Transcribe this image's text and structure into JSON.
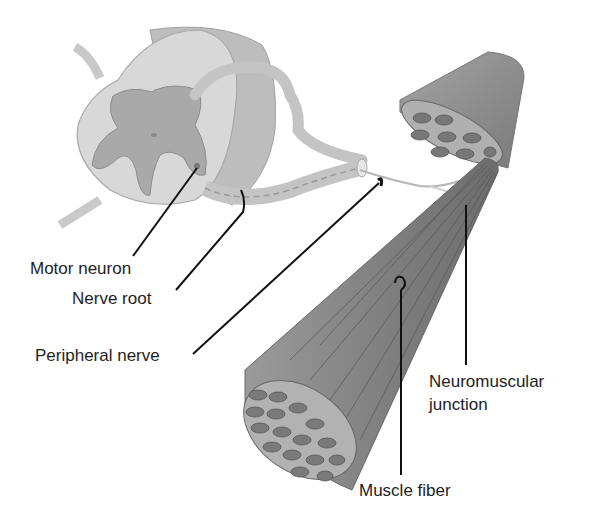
{
  "figure": {
    "labels": {
      "motor_neuron": "Motor neuron",
      "nerve_root": "Nerve root",
      "peripheral_nerve": "Peripheral nerve",
      "neuromuscular_junction_1": "Neuromuscular",
      "neuromuscular_junction_2": "junction",
      "muscle_fiber": "Muscle fiber"
    },
    "colors": {
      "cord_white_matter": "#d6d6d6",
      "cord_gray_matter": "#a9a9a9",
      "nerve": "#c8c8c8",
      "muscle": "#8a8a8a",
      "fascicle": "#6e6e6e",
      "leader_line": "#111111"
    }
  }
}
